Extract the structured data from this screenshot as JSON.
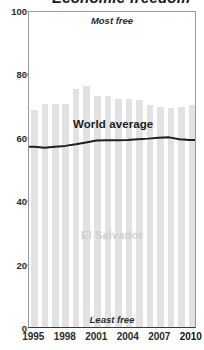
{
  "title_fragment": "Economic freedom",
  "annotations": {
    "most_free": "Most free",
    "least_free": "Least free",
    "country": "El Salvador",
    "world_average": "World average"
  },
  "axes": {
    "y_ticks": [
      "0",
      "20",
      "40",
      "60",
      "80",
      "100"
    ],
    "x_ticks": [
      "1995",
      "1998",
      "2001",
      "2004",
      "2007",
      "2010"
    ]
  },
  "colors": {
    "bar": "#e2e2e2",
    "line": "#1f1f1f",
    "frame": "#9a9a9a",
    "country_label": "#cfcfcf"
  },
  "chart_data": {
    "type": "bar",
    "title": "Economic freedom",
    "xlabel": "",
    "ylabel": "",
    "ylim": [
      0,
      100
    ],
    "xlim": [
      1994.5,
      2010.5
    ],
    "grid": false,
    "legend": "none",
    "categories": [
      1995,
      1996,
      1997,
      1998,
      1999,
      2000,
      2001,
      2002,
      2003,
      2004,
      2005,
      2006,
      2007,
      2008,
      2009,
      2010
    ],
    "series": [
      {
        "name": "El Salvador",
        "chart_type": "bar",
        "values": [
          68.5,
          70.5,
          70.5,
          70.5,
          75.0,
          76.0,
          73.0,
          73.0,
          72.0,
          72.0,
          71.5,
          70.0,
          69.5,
          69.0,
          69.5,
          70.0
        ]
      },
      {
        "name": "World average",
        "chart_type": "line",
        "values": [
          57.2,
          56.9,
          57.2,
          57.5,
          58.0,
          58.6,
          59.2,
          59.3,
          59.3,
          59.4,
          59.6,
          59.8,
          60.1,
          60.2,
          59.6,
          59.4
        ]
      }
    ],
    "annotations": [
      {
        "text": "Most free",
        "position": "top-center"
      },
      {
        "text": "Least free",
        "position": "bottom-center"
      },
      {
        "text": "El Salvador",
        "position": "center"
      },
      {
        "text": "World average",
        "position": "above-line"
      }
    ]
  }
}
